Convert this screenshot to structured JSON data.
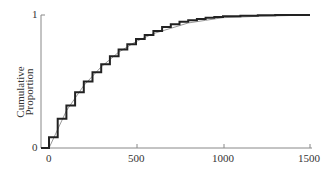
{
  "chart_data": {
    "type": "line",
    "title": "",
    "xlabel": "",
    "ylabel": "Cumulative Proportion",
    "ylabel_lines": [
      "Cumulative",
      "Proportion"
    ],
    "xlim": [
      0,
      1500
    ],
    "ylim": [
      0,
      1
    ],
    "xticks": [
      "0",
      "500",
      "1000",
      "1500"
    ],
    "yticks": [
      "0",
      "1"
    ],
    "grid": false,
    "legend": null,
    "series": [
      {
        "name": "empirical (step)",
        "style": "step, thick black",
        "x": [
          0,
          50,
          100,
          150,
          200,
          250,
          300,
          350,
          400,
          450,
          500,
          550,
          600,
          650,
          700,
          750,
          800,
          850,
          900,
          950,
          1000,
          1100,
          1200,
          1300,
          1500
        ],
        "y": [
          0.08,
          0.22,
          0.32,
          0.42,
          0.5,
          0.57,
          0.63,
          0.69,
          0.74,
          0.78,
          0.82,
          0.85,
          0.88,
          0.91,
          0.93,
          0.95,
          0.96,
          0.97,
          0.98,
          0.985,
          0.99,
          0.995,
          0.998,
          1.0,
          1.0
        ]
      },
      {
        "name": "fitted",
        "style": "thin gray",
        "x": [
          0,
          100,
          200,
          300,
          400,
          500,
          600,
          700,
          800,
          900,
          1000,
          1200,
          1500
        ],
        "y": [
          0.0,
          0.28,
          0.47,
          0.61,
          0.72,
          0.8,
          0.86,
          0.9,
          0.94,
          0.96,
          0.98,
          0.99,
          1.0
        ]
      }
    ]
  },
  "labels": {
    "y0": "0",
    "y1": "1",
    "x0": "0",
    "x500": "500",
    "x1000": "1000",
    "x1500": "1500",
    "ylabel_1": "Cumulative",
    "ylabel_2": "Proportion"
  }
}
